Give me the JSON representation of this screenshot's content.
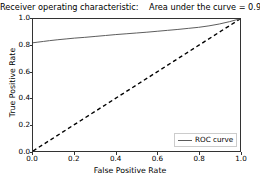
{
  "chart_data": {
    "type": "line",
    "title": "Receiver operating characteristic:    Area under the curve = 0.90",
    "xlabel": "False Positive Rate",
    "ylabel": "True Positive Rate",
    "xlim": [
      0.0,
      1.0
    ],
    "ylim": [
      0.0,
      1.0
    ],
    "grid": false,
    "legend_position": "lower right",
    "xticks": [
      "0.0",
      "0.2",
      "0.4",
      "0.6",
      "0.8",
      "1.0"
    ],
    "xtick_values": [
      0.0,
      0.2,
      0.4,
      0.6,
      0.8,
      1.0
    ],
    "yticks": [
      "0.0",
      "0.2",
      "0.4",
      "0.6",
      "0.8",
      "1.0"
    ],
    "ytick_values": [
      0.0,
      0.2,
      0.4,
      0.6,
      0.8,
      1.0
    ],
    "auc": 0.9,
    "series": [
      {
        "name": "ROC curve",
        "style": "solid",
        "color": "#5a5a5a",
        "x": [
          0.0,
          0.02,
          0.05,
          0.08,
          0.12,
          0.16,
          0.2,
          0.25,
          0.3,
          0.35,
          0.4,
          0.45,
          0.5,
          0.55,
          0.6,
          0.65,
          0.7,
          0.75,
          0.8,
          0.85,
          0.9,
          0.95,
          0.98,
          1.0
        ],
        "y": [
          0.82,
          0.824,
          0.83,
          0.836,
          0.843,
          0.849,
          0.855,
          0.861,
          0.868,
          0.875,
          0.882,
          0.888,
          0.894,
          0.9,
          0.907,
          0.914,
          0.921,
          0.929,
          0.937,
          0.948,
          0.962,
          0.98,
          0.993,
          1.0
        ]
      },
      {
        "name": "chance-diagonal",
        "style": "dashed",
        "color": "#000000",
        "x": [
          0.0,
          1.0
        ],
        "y": [
          0.0,
          1.0
        ]
      }
    ]
  },
  "legend": {
    "label": "ROC curve"
  }
}
